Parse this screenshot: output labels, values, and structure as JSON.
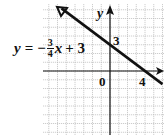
{
  "chart_data": {
    "type": "line",
    "title": "",
    "equation": {
      "lhs": "y",
      "eq": "=",
      "sign": "−",
      "numerator": "3",
      "denominator": "4",
      "var": "x",
      "rest": "+ 3"
    },
    "slope": -0.75,
    "intercept": 3,
    "x_intercept": 4,
    "xlabel": "x",
    "ylabel": "y",
    "tick_labels": {
      "origin": "0",
      "y_intercept": "3",
      "x_intercept": "4"
    },
    "grid": true,
    "xlim": [
      -7.6,
      6.2
    ],
    "ylim": [
      -7.3,
      7.6
    ],
    "series": [
      {
        "name": "y = -3/4 x + 3",
        "x": [
          -6,
          6
        ],
        "y": [
          7.5,
          -1.5
        ]
      }
    ]
  },
  "colors": {
    "grid": "#b8b8b8",
    "axis": "#111111",
    "line": "#111111"
  }
}
